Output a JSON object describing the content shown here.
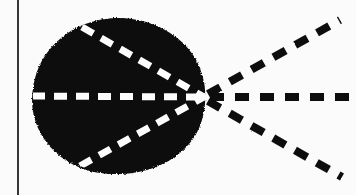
{
  "figure": {
    "type": "scanned-diagram",
    "title": "",
    "caption": "",
    "canvas": {
      "width": 356,
      "height": 195
    },
    "colors": {
      "background": "#fbfbfb",
      "ink": "#0d0d0d",
      "dash_light": "#fdfdfd",
      "rule": "#1a1a1a"
    },
    "margin_rule": {
      "name": "left-margin-rule",
      "orientation": "vertical",
      "x": 18,
      "y_start": 0,
      "y_end": 195,
      "thickness": 2
    },
    "blob": {
      "name": "dark-region",
      "description": "solid black rounded region, teardrop-like, flattened toward focus on the right",
      "center_x": 118,
      "center_y": 96,
      "radius_x": 86,
      "radius_y": 78,
      "left_edge_x": 33,
      "right_edge_x": 205,
      "top_edge_y": 18,
      "bottom_edge_y": 174
    },
    "focus_point": {
      "name": "convergence-point",
      "x": 204,
      "y": 97
    },
    "rays": [
      {
        "id": "ray-upper-interior",
        "label": "upper interior chord",
        "stroke": "light",
        "x1": 82,
        "y1": 27,
        "x2": 204,
        "y2": 97
      },
      {
        "id": "ray-axis-interior",
        "label": "horizontal axis chord",
        "stroke": "light",
        "x1": 32,
        "y1": 96,
        "x2": 204,
        "y2": 97
      },
      {
        "id": "ray-lower-interior",
        "label": "lower interior chord",
        "stroke": "light",
        "x1": 80,
        "y1": 166,
        "x2": 204,
        "y2": 97
      },
      {
        "id": "ray-upper-exterior",
        "label": "upper diverging ray",
        "stroke": "ink",
        "x1": 208,
        "y1": 94,
        "x2": 340,
        "y2": 20
      },
      {
        "id": "ray-axis-exterior",
        "label": "horizontal diverging ray",
        "stroke": "ink",
        "x1": 210,
        "y1": 97,
        "x2": 356,
        "y2": 97
      },
      {
        "id": "ray-lower-exterior",
        "label": "lower diverging ray",
        "stroke": "ink",
        "x1": 208,
        "y1": 101,
        "x2": 342,
        "y2": 177
      }
    ],
    "dash_pattern": {
      "interior_dash": 13,
      "interior_gap": 9,
      "interior_width": 7,
      "exterior_dash": 14,
      "exterior_gap": 11,
      "exterior_width": 8
    }
  }
}
